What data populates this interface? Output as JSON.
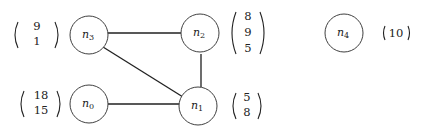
{
  "graph": {
    "nodes": [
      {
        "id": "n0",
        "name": "n",
        "sub": "0",
        "cx": 89,
        "cy": 104,
        "r": 19,
        "vector": [
          "18",
          "15"
        ],
        "vector_side": "left"
      },
      {
        "id": "n1",
        "name": "n",
        "sub": "1",
        "cx": 198,
        "cy": 106,
        "r": 19,
        "vector": [
          "5",
          "8"
        ],
        "vector_side": "right"
      },
      {
        "id": "n2",
        "name": "n",
        "sub": "2",
        "cx": 200,
        "cy": 35,
        "r": 19,
        "vector": [
          "8",
          "9",
          "5"
        ],
        "vector_side": "right"
      },
      {
        "id": "n3",
        "name": "n",
        "sub": "3",
        "cx": 89,
        "cy": 35,
        "r": 19,
        "vector": [
          "9",
          "1"
        ],
        "vector_side": "left"
      },
      {
        "id": "n4",
        "name": "n",
        "sub": "4",
        "cx": 344,
        "cy": 33,
        "r": 19,
        "vector": [
          "10"
        ],
        "vector_side": "right"
      }
    ],
    "edges": [
      {
        "from": "n3",
        "to": "n2"
      },
      {
        "from": "n3",
        "to": "n1"
      },
      {
        "from": "n2",
        "to": "n1"
      },
      {
        "from": "n0",
        "to": "n1"
      }
    ]
  }
}
